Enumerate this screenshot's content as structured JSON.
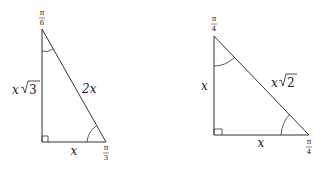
{
  "triangles": [
    {
      "name": "30-60-90",
      "top_angle": {
        "num": "π",
        "den": "6"
      },
      "bottom_angle": {
        "num": "π",
        "den": "3"
      },
      "vertical_side": "x√3",
      "vertical_side_var": "x",
      "vertical_side_root": "3",
      "hypotenuse": "2x",
      "base": "x"
    },
    {
      "name": "45-45-90",
      "top_angle": {
        "num": "π",
        "den": "4"
      },
      "bottom_angle": {
        "num": "π",
        "den": "4"
      },
      "vertical_side": "x",
      "hypotenuse_var": "x",
      "hypotenuse_root": "2",
      "base": "x"
    }
  ]
}
